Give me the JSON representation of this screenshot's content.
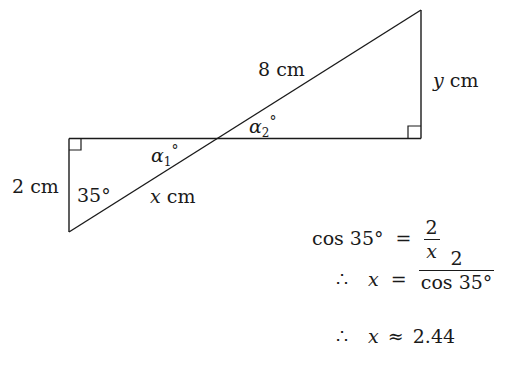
{
  "diagram": {
    "colors": {
      "line": "#1a1a1a",
      "background": "#ffffff"
    },
    "shapes": {
      "left_triangle": {
        "vertices": [
          [
            69,
            139
          ],
          [
            69,
            232
          ],
          [
            220,
            138
          ]
        ],
        "right_angle_at": [
          69,
          139
        ]
      },
      "right_triangle": {
        "vertices": [
          [
            220,
            138
          ],
          [
            421,
            10
          ],
          [
            421,
            138
          ]
        ],
        "right_angle_at": [
          421,
          138
        ]
      }
    },
    "labels": {
      "hyp_right": "8 cm",
      "side_right_var": "y",
      "side_right_unit": " cm",
      "side_left": "2 cm",
      "angle_left": "35°",
      "hyp_left_var": "x",
      "hyp_left_unit": " cm",
      "alpha1_sym": "α",
      "alpha1_sub": "1",
      "alpha1_deg": "°",
      "alpha2_sym": "α",
      "alpha2_sub": "2",
      "alpha2_deg": "°"
    },
    "working": {
      "line1": {
        "lhs": "cos 35°",
        "eq": "=",
        "num": "2",
        "den": "x"
      },
      "line2": {
        "therefore": "∴",
        "lhs": "x",
        "eq": "=",
        "num": "2",
        "den": "cos 35°"
      },
      "line3": {
        "therefore": "∴",
        "lhs": "x",
        "approx": "≈",
        "value": "2.44"
      }
    }
  }
}
